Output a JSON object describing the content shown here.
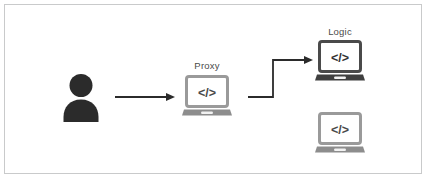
{
  "diagram": {
    "background_color": "#ffffff",
    "frame_border_color": "#c9cacb",
    "colors": {
      "dark": "#2b2b2b",
      "mid_dark": "#4a4a4a",
      "light_gray": "#9a9a9a",
      "base_gray": "#8d8d8d",
      "label_text": "#4a4a4a",
      "arrow": "#2b2b2b"
    },
    "nodes": [
      {
        "id": "user",
        "type": "person-icon",
        "label": "",
        "color": "#2b2b2b"
      },
      {
        "id": "proxy",
        "type": "laptop-icon",
        "label": "Proxy",
        "screen_text": "</>",
        "color": "#9a9a9a"
      },
      {
        "id": "logic",
        "type": "laptop-icon",
        "label": "Logic",
        "screen_text": "</>",
        "color": "#4a4a4a"
      },
      {
        "id": "backend-secondary",
        "type": "laptop-icon",
        "label": "",
        "screen_text": "</>",
        "color": "#9a9a9a"
      }
    ],
    "connections": [
      {
        "id": "user-to-proxy",
        "from": "user",
        "to": "proxy",
        "style": "straight-arrow"
      },
      {
        "id": "proxy-to-logic",
        "from": "proxy",
        "to": "logic",
        "style": "elbow-arrow"
      }
    ]
  }
}
